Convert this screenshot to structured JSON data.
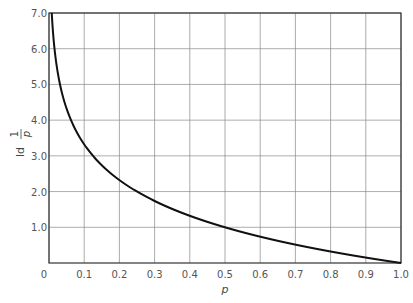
{
  "chart_data": {
    "type": "line",
    "title": "",
    "xlabel": "p",
    "ylabel": "ld 1/p",
    "xlim": [
      0,
      1.0
    ],
    "ylim": [
      0,
      7.0
    ],
    "grid": true,
    "legend": null,
    "x_ticks": [
      "0",
      "0.1",
      "0.2",
      "0.3",
      "0.4",
      "0.5",
      "0.6",
      "0.7",
      "0.8",
      "0.9",
      "1.0"
    ],
    "y_ticks": [
      "1.0",
      "2.0",
      "3.0",
      "4.0",
      "5.0",
      "6.0",
      "7.0"
    ],
    "series": [
      {
        "name": "ld(1/p)",
        "x": [
          0.0078,
          0.01,
          0.02,
          0.03,
          0.05,
          0.075,
          0.1,
          0.15,
          0.2,
          0.25,
          0.3,
          0.35,
          0.4,
          0.45,
          0.5,
          0.6,
          0.7,
          0.8,
          0.9,
          1.0
        ],
        "y": [
          7.0,
          6.64,
          5.64,
          5.06,
          4.32,
          3.74,
          3.32,
          2.74,
          2.32,
          2.0,
          1.74,
          1.51,
          1.32,
          1.15,
          1.0,
          0.74,
          0.51,
          0.32,
          0.15,
          0.0
        ]
      }
    ]
  },
  "axes": {
    "x_label": "p",
    "y_label_prefix": "ld",
    "y_label_num": "1",
    "y_label_den": "p"
  }
}
